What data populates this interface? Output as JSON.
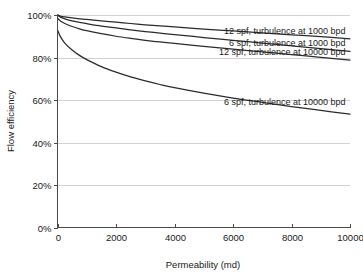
{
  "chart_data": {
    "type": "line",
    "title": "",
    "xlabel": "Permeability (md)",
    "ylabel": "Flow efficiency",
    "xlim": [
      0,
      10000
    ],
    "ylim": [
      0,
      1.0
    ],
    "grid": "horizontal",
    "legend_position": "inline-on-curve",
    "xticks": [
      0,
      2000,
      4000,
      6000,
      8000,
      10000
    ],
    "xtick_labels": [
      "0",
      "2000",
      "4000",
      "6000",
      "8000",
      "10000"
    ],
    "yticks": [
      0,
      0.2,
      0.4,
      0.6,
      0.8,
      1.0
    ],
    "ytick_labels": [
      "0%",
      "20%",
      "40%",
      "60%",
      "80%",
      "100%"
    ],
    "x": [
      0,
      100,
      250,
      500,
      750,
      1000,
      1500,
      2000,
      2500,
      3000,
      3500,
      4000,
      5000,
      6000,
      7000,
      8000,
      9000,
      10000
    ],
    "series": [
      {
        "name": "12 spf, turbulence at 1000 bpd",
        "label": "12 spf, turbulence at 1000 bpd",
        "color": "#2b2b2b",
        "values": [
          1.0,
          0.995,
          0.991,
          0.986,
          0.982,
          0.979,
          0.972,
          0.966,
          0.96,
          0.954,
          0.949,
          0.944,
          0.934,
          0.925,
          0.916,
          0.907,
          0.898,
          0.888
        ]
      },
      {
        "name": "6 spf, turbulence at 1000 bpd",
        "label": "6 spf, turbulence at 1000 bpd",
        "color": "#2b2b2b",
        "values": [
          1.0,
          0.99,
          0.982,
          0.972,
          0.965,
          0.959,
          0.948,
          0.939,
          0.93,
          0.922,
          0.915,
          0.908,
          0.894,
          0.881,
          0.868,
          0.855,
          0.842,
          0.829
        ]
      },
      {
        "name": "12 spf, turbulence at 10000 bpd",
        "label": "12 spf, turbulence at 10000 bpd",
        "color": "#2b2b2b",
        "values": [
          0.985,
          0.972,
          0.96,
          0.946,
          0.935,
          0.926,
          0.912,
          0.9,
          0.89,
          0.881,
          0.873,
          0.866,
          0.852,
          0.839,
          0.827,
          0.814,
          0.801,
          0.788
        ]
      },
      {
        "name": "6 spf, turbulence at 10000 bpd",
        "label": "6 spf, turbulence at 10000 bpd",
        "color": "#2b2b2b",
        "values": [
          0.93,
          0.898,
          0.868,
          0.835,
          0.81,
          0.79,
          0.757,
          0.731,
          0.709,
          0.69,
          0.673,
          0.658,
          0.632,
          0.609,
          0.589,
          0.569,
          0.551,
          0.533
        ]
      }
    ],
    "series_label_anchor": [
      {
        "x": 9850,
        "y": 0.912
      },
      {
        "x": 9850,
        "y": 0.852
      },
      {
        "x": 9850,
        "y": 0.811
      },
      {
        "x": 9850,
        "y": 0.575
      }
    ]
  }
}
